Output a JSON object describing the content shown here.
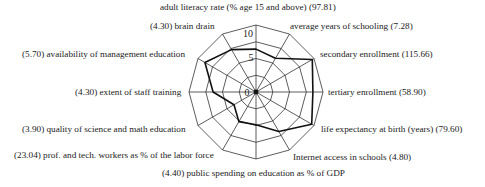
{
  "chart_data": {
    "type": "radar",
    "title": "",
    "scale": {
      "min": 0,
      "max": 10,
      "ticks": [
        0,
        5,
        10
      ],
      "rings": [
        2.5,
        5,
        7.5,
        10
      ]
    },
    "axes": [
      {
        "label": "adult literacy rate (% age 15 and above) (97.81)",
        "raw": "97.81",
        "value": 6.4
      },
      {
        "label": "average years of schooling (7.28)",
        "raw": "7.28",
        "value": 5.8
      },
      {
        "label": "secondary enrollment (115.66)",
        "raw": "115.66",
        "value": 9.7
      },
      {
        "label": "tertiary enrollment (58.90)",
        "raw": "58.90",
        "value": 8.5
      },
      {
        "label": "life expectancy at birth (years) (79.60)",
        "raw": "79.60",
        "value": 9.6
      },
      {
        "label": "Internet access in schools (4.80)",
        "raw": "4.80",
        "value": 6.8
      },
      {
        "label": "(4.40) public spending on education as % of GDP",
        "raw": "4.40",
        "value": 4.9
      },
      {
        "label": "(23.04) prof. and tech. workers as % of the labor force",
        "raw": "23.04",
        "value": 5.1
      },
      {
        "label": "(3.90) quality of science and math education",
        "raw": "3.90",
        "value": 3.8
      },
      {
        "label": "(4.30) extent of staff training",
        "raw": "4.30",
        "value": 6.4
      },
      {
        "label": "(5.70) availability of management education",
        "raw": "5.70",
        "value": 8.8
      },
      {
        "label": "(4.30) brain drain",
        "raw": "4.30",
        "value": 7.3
      }
    ],
    "tick_labels": [
      "0",
      "5",
      "10"
    ],
    "grid": true,
    "legend": null
  }
}
